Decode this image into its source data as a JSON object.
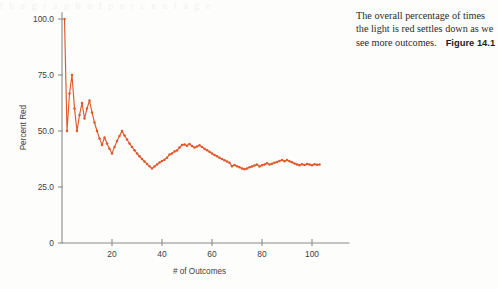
{
  "page": {
    "background_color": "#fdfdfb",
    "scan_ghost_text": "t h e   g r a p h   o f   p e r c e n t a g e"
  },
  "caption": {
    "text": "The overall percentage of times the light is red settles down as we see more outcomes.",
    "figure_label": "Figure 14.1"
  },
  "chart_data": {
    "type": "line",
    "title": "",
    "xlabel": "# of Outcomes",
    "ylabel": "Percent Red",
    "xlim": [
      0,
      115
    ],
    "ylim": [
      0,
      103
    ],
    "xticks": [
      20,
      40,
      60,
      80,
      100
    ],
    "xtick_labels": [
      "20",
      "40",
      "60",
      "80",
      "100"
    ],
    "yticks": [
      0,
      25,
      50,
      75,
      100
    ],
    "ytick_labels": [
      "0",
      "25.0",
      "50.0",
      "75.0",
      "100.0"
    ],
    "grid": false,
    "legend": false,
    "series_color": "#e2582b",
    "marker": "circle",
    "series": [
      {
        "name": "Percent Red",
        "x": [
          1,
          2,
          3,
          4,
          5,
          6,
          7,
          8,
          9,
          10,
          11,
          12,
          13,
          14,
          15,
          16,
          17,
          18,
          19,
          20,
          21,
          22,
          23,
          24,
          25,
          26,
          27,
          28,
          29,
          30,
          31,
          32,
          33,
          34,
          35,
          36,
          37,
          38,
          39,
          40,
          41,
          42,
          43,
          44,
          45,
          46,
          47,
          48,
          49,
          50,
          51,
          52,
          53,
          54,
          55,
          56,
          57,
          58,
          59,
          60,
          61,
          62,
          63,
          64,
          65,
          66,
          67,
          68,
          69,
          70,
          71,
          72,
          73,
          74,
          75,
          76,
          77,
          78,
          79,
          80,
          81,
          82,
          83,
          84,
          85,
          86,
          87,
          88,
          89,
          90,
          91,
          92,
          93,
          94,
          95,
          96,
          97,
          98,
          99,
          100,
          101,
          102,
          103
        ],
        "values": [
          100.0,
          50.0,
          66.7,
          75.0,
          60.0,
          50.0,
          57.1,
          62.5,
          55.6,
          60.0,
          63.6,
          58.3,
          53.8,
          50.0,
          46.7,
          43.8,
          47.1,
          44.4,
          42.1,
          40.0,
          42.9,
          45.5,
          47.8,
          50.0,
          48.0,
          46.2,
          44.4,
          42.9,
          41.4,
          40.0,
          38.7,
          37.5,
          36.4,
          35.3,
          34.3,
          33.3,
          34.2,
          35.0,
          35.9,
          36.6,
          37.2,
          38.1,
          39.5,
          40.0,
          40.9,
          41.3,
          42.6,
          43.8,
          44.0,
          43.4,
          44.2,
          43.3,
          42.6,
          43.1,
          43.6,
          42.9,
          42.1,
          41.4,
          40.7,
          40.0,
          39.3,
          38.7,
          38.1,
          37.5,
          36.9,
          36.4,
          35.8,
          34.3,
          34.8,
          34.3,
          33.8,
          33.3,
          32.9,
          33.3,
          33.8,
          34.2,
          34.6,
          35.0,
          34.2,
          34.7,
          35.1,
          35.6,
          35.0,
          35.4,
          35.8,
          36.2,
          36.6,
          37.0,
          36.5,
          37.1,
          36.5,
          36.0,
          35.5,
          35.1,
          34.7,
          35.2,
          34.8,
          35.3,
          35.0,
          34.7,
          35.2,
          34.9,
          35.0
        ]
      }
    ]
  }
}
